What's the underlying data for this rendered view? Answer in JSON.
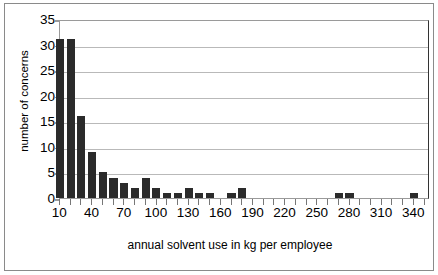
{
  "chart_data": {
    "type": "bar",
    "title": "",
    "xlabel": "annual solvent use in kg per employee",
    "ylabel": "number of concerns",
    "xlim": [
      5,
      350
    ],
    "ylim": [
      0,
      35
    ],
    "grid": true,
    "legend": false,
    "bin_width": 10,
    "xticks": [
      10,
      40,
      70,
      100,
      130,
      160,
      190,
      220,
      250,
      280,
      310,
      340
    ],
    "xtick_labels": [
      "10",
      "40",
      "70",
      "100",
      "130",
      "160",
      "190",
      "220",
      "250",
      "280",
      "310",
      "340"
    ],
    "yticks": [
      0,
      5,
      10,
      15,
      20,
      25,
      30,
      35
    ],
    "ytick_labels": [
      "0",
      "5",
      "10",
      "15",
      "20",
      "25",
      "30",
      "35"
    ],
    "categories": [
      10,
      20,
      30,
      40,
      50,
      60,
      70,
      80,
      90,
      100,
      110,
      120,
      130,
      140,
      150,
      160,
      170,
      180,
      190,
      200,
      210,
      220,
      230,
      240,
      250,
      260,
      270,
      280,
      290,
      300,
      310,
      320,
      330,
      340
    ],
    "values": [
      31,
      31,
      16,
      9,
      5,
      4,
      3,
      2,
      4,
      2,
      1,
      1,
      2,
      1,
      1,
      0,
      1,
      2,
      0,
      0,
      0,
      0,
      0,
      0,
      0,
      0,
      1,
      1,
      0,
      0,
      0,
      0,
      0,
      1
    ]
  }
}
